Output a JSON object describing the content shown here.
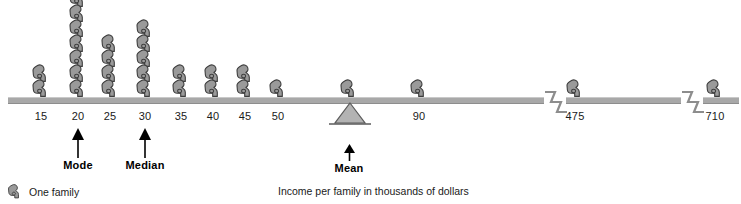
{
  "chart_data": {
    "type": "bar",
    "title": "",
    "subtitle": "",
    "xlabel": "Income per family in thousands of dollars",
    "ylabel": "",
    "unit_note": "One family",
    "categories": [
      "15",
      "20",
      "25",
      "30",
      "35",
      "40",
      "45",
      "50",
      "70",
      "90",
      "475",
      "710"
    ],
    "values": [
      2,
      7,
      4,
      5,
      2,
      2,
      2,
      1,
      1,
      1,
      1,
      1
    ],
    "series": [
      {
        "name": "One family",
        "values": [
          2,
          7,
          4,
          5,
          2,
          2,
          2,
          1,
          1,
          1,
          1,
          1
        ]
      }
    ],
    "grid": false,
    "legend_position": "bottom-left",
    "axis_breaks": [
      "before-475",
      "before-710"
    ],
    "annotations": [
      {
        "label": "Mode",
        "value": "20",
        "type": "up-arrow"
      },
      {
        "label": "Median",
        "value": "30",
        "type": "up-arrow"
      },
      {
        "label": "Mean",
        "value": "70",
        "type": "fulcrum-up-arrow"
      }
    ],
    "statistics": {
      "mode": 20,
      "median": 30,
      "mean": 70
    },
    "total_families": 29
  },
  "axis": {
    "ticks": [
      {
        "label": "15",
        "x": 41,
        "count": 2
      },
      {
        "label": "20",
        "x": 78,
        "count": 7
      },
      {
        "label": "25",
        "x": 110,
        "count": 4
      },
      {
        "label": "30",
        "x": 145,
        "count": 5
      },
      {
        "label": "35",
        "x": 181,
        "count": 2
      },
      {
        "label": "40",
        "x": 213,
        "count": 2
      },
      {
        "label": "45",
        "x": 245,
        "count": 2
      },
      {
        "label": "50",
        "x": 278,
        "count": 1
      },
      {
        "label": "70",
        "x": 349,
        "count": 1
      },
      {
        "label": "90",
        "x": 419,
        "count": 1
      },
      {
        "label": "475",
        "x": 575,
        "count": 1
      },
      {
        "label": "710",
        "x": 715,
        "count": 1
      }
    ]
  },
  "markers": {
    "mode": {
      "label": "Mode",
      "x": 78
    },
    "median": {
      "label": "Median",
      "x": 145
    },
    "mean": {
      "label": "Mean",
      "x": 349,
      "value": "70"
    }
  },
  "legend": {
    "item_label": "One family",
    "icon": "seated-family-figure-icon"
  },
  "caption": {
    "text": "Income per family in thousands of dollars"
  },
  "colors": {
    "figure_fill": "#9a9a9a",
    "figure_outline": "#3d3d3d",
    "axis_bar": "#a8a8a8",
    "fulcrum_fill": "#b3b3b3",
    "text": "#1a1a1a",
    "background": "#ffffff"
  }
}
